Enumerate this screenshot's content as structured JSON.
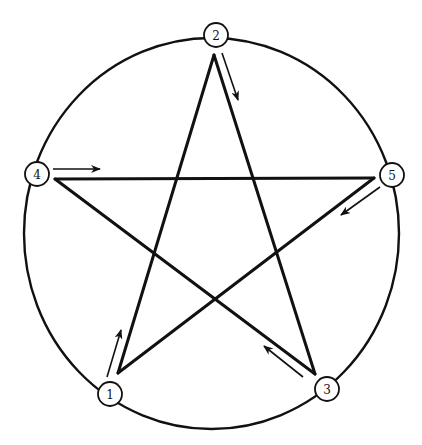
{
  "diagram": {
    "type": "pentagram-in-circle",
    "outer_circle": {
      "cx": 211.5,
      "cy": 233.5,
      "rx": 187.5,
      "ry": 195.5
    },
    "colors": {
      "stroke": "#111111",
      "background": "#ffffff"
    },
    "nodes": [
      {
        "id": "1",
        "label": "1",
        "cx": 110,
        "cy": 394
      },
      {
        "id": "2",
        "label": "2",
        "cx": 216,
        "cy": 35
      },
      {
        "id": "3",
        "label": "3",
        "cx": 327,
        "cy": 389
      },
      {
        "id": "4",
        "label": "4",
        "cx": 37,
        "cy": 174
      },
      {
        "id": "5",
        "label": "5",
        "cx": 392,
        "cy": 175
      }
    ],
    "star_vertices": {
      "1": {
        "x": 118,
        "y": 373
      },
      "2": {
        "x": 214,
        "y": 55
      },
      "3": {
        "x": 315,
        "y": 374
      },
      "4": {
        "x": 55,
        "y": 179
      },
      "5": {
        "x": 374,
        "y": 178
      }
    },
    "drawing_order": [
      "1",
      "2",
      "3",
      "4",
      "5",
      "1"
    ],
    "arrows": [
      {
        "from_node": "1",
        "x1": 107,
        "y1": 377,
        "x2": 121,
        "y2": 330
      },
      {
        "from_node": "2",
        "x1": 222,
        "y1": 53,
        "x2": 238,
        "y2": 100
      },
      {
        "from_node": "3",
        "x1": 303,
        "y1": 377,
        "x2": 264,
        "y2": 346
      },
      {
        "from_node": "4",
        "x1": 53,
        "y1": 169,
        "x2": 100,
        "y2": 169
      },
      {
        "from_node": "5",
        "x1": 380,
        "y1": 187,
        "x2": 341,
        "y2": 215
      }
    ],
    "node_radius": 12
  }
}
